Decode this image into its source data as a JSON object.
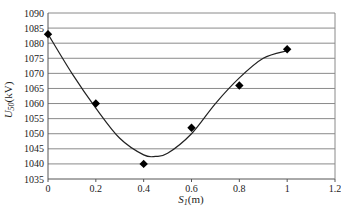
{
  "chart_data": {
    "type": "scatter",
    "title": "",
    "xlabel": "S_1(m)",
    "xlabel_main": "S",
    "xlabel_sub": "1",
    "xlabel_unit": "(m)",
    "ylabel": "U_50(kV)",
    "ylabel_main": "U",
    "ylabel_sub": "50",
    "ylabel_unit": "(kV)",
    "xlim": [
      0,
      1.2
    ],
    "ylim": [
      1035,
      1090
    ],
    "x_ticks": [
      "0",
      "0.2",
      "0.4",
      "0.6",
      "0.8",
      "1",
      "1.2"
    ],
    "y_ticks": [
      "1035",
      "1040",
      "1045",
      "1050",
      "1055",
      "1060",
      "1065",
      "1070",
      "1075",
      "1080",
      "1085",
      "1090"
    ],
    "grid": "horizontal",
    "legend": "none",
    "series": [
      {
        "name": "measured",
        "marker": "diamond",
        "x": [
          0,
          0.2,
          0.4,
          0.6,
          0.8,
          1.0
        ],
        "values": [
          1083,
          1060,
          1040,
          1052,
          1066,
          1078
        ]
      },
      {
        "name": "fitted curve",
        "style": "smooth line",
        "x": [
          0,
          0.1,
          0.2,
          0.3,
          0.4,
          0.45,
          0.5,
          0.6,
          0.7,
          0.8,
          0.9,
          1.0
        ],
        "values": [
          1083,
          1070,
          1058.5,
          1048.5,
          1043,
          1042.5,
          1043.5,
          1050,
          1060,
          1068.5,
          1075,
          1077.5
        ]
      }
    ],
    "colors": {
      "line": "#222222",
      "marker": "#000000",
      "grid": "#8a8a8a",
      "axis": "#555555"
    }
  }
}
